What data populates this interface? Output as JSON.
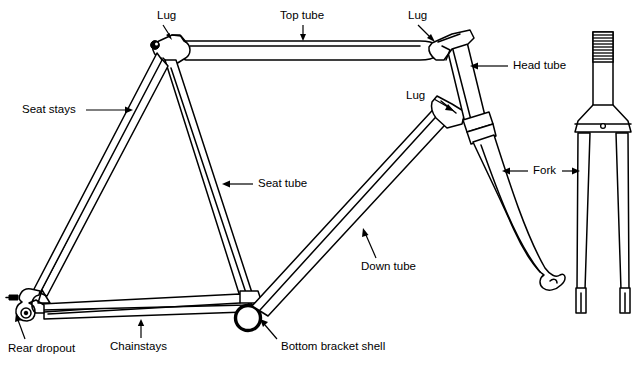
{
  "diagram": {
    "type": "technical-line-drawing",
    "style": "black-and-white-outline",
    "background_color": "#ffffff",
    "line_color": "#000000",
    "labels": {
      "lug_seat": "Lug",
      "top_tube": "Top tube",
      "lug_head_top": "Lug",
      "head_tube": "Head tube",
      "lug_head_bottom": "Lug",
      "seat_stays": "Seat stays",
      "seat_tube": "Seat tube",
      "fork": "Fork",
      "down_tube": "Down tube",
      "rear_dropout": "Rear dropout",
      "chainstays": "Chainstays",
      "bottom_bracket_shell": "Bottom bracket shell"
    },
    "parts": [
      {
        "id": "lug-seat",
        "name": "Lug",
        "label": "Lug",
        "description": "Seat lug joining top tube and seat tube at the seat cluster",
        "label_x": 157,
        "label_y": 16,
        "arrow_from_x": 163,
        "arrow_from_y": 25,
        "arrow_to_x": 164,
        "arrow_to_y": 42
      },
      {
        "id": "top-tube",
        "name": "Top tube",
        "label": "Top tube",
        "description": "Horizontal tube from seat lug to head tube",
        "label_x": 309,
        "label_y": 16,
        "arrow_from_x": 303,
        "arrow_from_y": 25,
        "arrow_to_x": 303,
        "arrow_to_y": 44
      },
      {
        "id": "lug-head-top",
        "name": "Lug",
        "label": "Lug",
        "description": "Upper head lug joining top tube to head tube",
        "label_x": 419,
        "label_y": 16,
        "arrow_from_x": 424,
        "arrow_from_y": 25,
        "arrow_to_x": 435,
        "arrow_to_y": 42
      },
      {
        "id": "head-tube",
        "name": "Head tube",
        "label": "Head tube",
        "description": "Short angled tube that houses the headset and fork steerer",
        "label_x": 513,
        "label_y": 66,
        "arrow_from_x": 508,
        "arrow_from_y": 66,
        "arrow_to_x": 470,
        "arrow_to_y": 66
      },
      {
        "id": "lug-head-bottom",
        "name": "Lug",
        "label": "Lug",
        "description": "Lower head lug joining down tube to head tube",
        "label_x": 420,
        "label_y": 96,
        "arrow_from_x": 434,
        "arrow_from_y": 99,
        "arrow_to_x": 452,
        "arrow_to_y": 110
      },
      {
        "id": "seat-stays",
        "name": "Seat stays",
        "label": "Seat stays",
        "description": "Pair of thin tubes from seat cluster to rear dropouts",
        "label_x": 22,
        "label_y": 110,
        "arrow_from_x": 86,
        "arrow_from_y": 110,
        "arrow_to_x": 133,
        "arrow_to_y": 110
      },
      {
        "id": "seat-tube",
        "name": "Seat tube",
        "label": "Seat tube",
        "description": "Tube from seat lug down to bottom bracket shell",
        "label_x": 258,
        "label_y": 184,
        "arrow_from_x": 253,
        "arrow_from_y": 184,
        "arrow_to_x": 222,
        "arrow_to_y": 184
      },
      {
        "id": "fork",
        "name": "Fork",
        "label": "Fork",
        "description": "Front fork shown in side view and front view",
        "label_x": 543,
        "label_y": 171,
        "arrow_left_from_x": 533,
        "arrow_left_from_y": 171,
        "arrow_left_to_x": 502,
        "arrow_left_to_y": 171,
        "arrow_right_from_x": 560,
        "arrow_right_from_y": 171,
        "arrow_right_to_x": 580,
        "arrow_right_to_y": 171
      },
      {
        "id": "down-tube",
        "name": "Down tube",
        "label": "Down tube",
        "description": "Large tube from head lug down to bottom bracket shell",
        "label_x": 361,
        "label_y": 267,
        "arrow_from_x": 376,
        "arrow_from_y": 258,
        "arrow_to_x": 363,
        "arrow_to_y": 228
      },
      {
        "id": "rear-dropout",
        "name": "Rear dropout",
        "label": "Rear dropout",
        "description": "Slotted plate where rear wheel axle attaches",
        "label_x": 8,
        "label_y": 349,
        "arrow_from_x": 22,
        "arrow_from_y": 339,
        "arrow_to_x": 16,
        "arrow_to_y": 313
      },
      {
        "id": "chainstays",
        "name": "Chainstays",
        "label": "Chainstays",
        "description": "Pair of tubes from bottom bracket to rear dropouts",
        "label_x": 110,
        "label_y": 347,
        "arrow_from_x": 141,
        "arrow_from_y": 338,
        "arrow_to_x": 141,
        "arrow_to_y": 319
      },
      {
        "id": "bottom-bracket-shell",
        "name": "Bottom bracket shell",
        "label": "Bottom bracket shell",
        "description": "Cylindrical shell at the junction of seat tube, down tube and chainstays",
        "label_x": 281,
        "label_y": 347,
        "arrow_from_x": 277,
        "arrow_from_y": 339,
        "arrow_to_x": 262,
        "arrow_to_y": 319
      }
    ]
  }
}
